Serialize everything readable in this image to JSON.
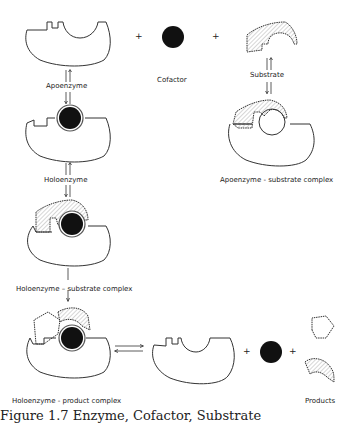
{
  "diagram": {
    "type": "enzyme-cofactor-substrate reaction scheme",
    "labels": {
      "apoenzyme": "Apoenzyme",
      "cofactor": "Cofactor",
      "substrate": "Substrate",
      "apoenzyme_substrate_complex": "Apoenzyme - substrate complex",
      "holoenzyme": "Holoenzyme",
      "holoenzyme_substrate_complex": "Holoenzyme – substrate complex",
      "holoenzyme_product_complex": "Holoenzyme - product complex",
      "products": "Products"
    },
    "operators": {
      "plus": "+"
    },
    "caption_partial": "Figure 1.7   Enzyme, Cofactor, Substrate"
  }
}
